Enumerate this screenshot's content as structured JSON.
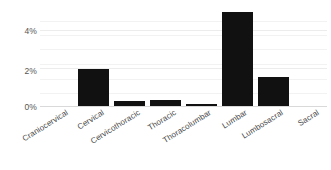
{
  "chart_data": {
    "type": "bar",
    "title": "",
    "subtitle": "",
    "xlabel": "",
    "ylabel": "",
    "categories": [
      "Craniocervical",
      "Cervical",
      "Cervicothoracic",
      "Thoracic",
      "Thoracolumbar",
      "Lumbar",
      "Lumbosacral",
      "Sacral"
    ],
    "values": [
      0.03,
      2.0,
      0.3,
      0.37,
      0.15,
      5.0,
      1.6,
      0.08
    ],
    "value_unit": "%",
    "ylim": [
      0,
      5.5
    ],
    "yticks": [
      0,
      2,
      4
    ],
    "ytick_labels": [
      "0%",
      "2%",
      "4%"
    ],
    "minor_gridlines": [
      0.7,
      1.45,
      2.2,
      3.0,
      3.75,
      4.5
    ],
    "grid": true,
    "grid_color": "#f2f2f2",
    "legend": null,
    "legend_position": "none",
    "bar_color": "#111111",
    "baseline_color": "#d9d9d9",
    "tick_label_color": "#4a4a4a",
    "tick_label_rotation": -32
  },
  "axis": {
    "y_labels": [
      "4%",
      "2%",
      "0%"
    ]
  }
}
